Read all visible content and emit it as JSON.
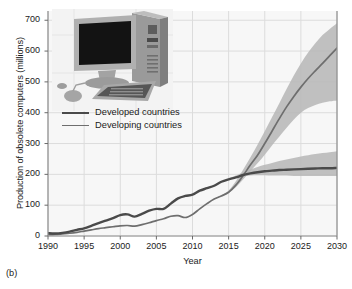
{
  "figure": {
    "caption": "(b)",
    "photo_alt": "desktop-computer-photo"
  },
  "chart_data": {
    "type": "line",
    "title": "",
    "xlabel": "Year",
    "ylabel": "Production of obsolete computers (millions)",
    "xlim": [
      1990,
      2030
    ],
    "ylim": [
      0,
      730
    ],
    "xticks": [
      1990,
      1995,
      2000,
      2005,
      2010,
      2015,
      2020,
      2025,
      2030
    ],
    "yticks": [
      0,
      100,
      200,
      300,
      400,
      500,
      600,
      700
    ],
    "grid": true,
    "legend_position": "upper-left-inside",
    "x": [
      1990,
      1991,
      1992,
      1993,
      1994,
      1995,
      1996,
      1997,
      1998,
      1999,
      2000,
      2001,
      2002,
      2003,
      2004,
      2005,
      2006,
      2007,
      2008,
      2009,
      2010,
      2011,
      2012,
      2013,
      2014,
      2015,
      2016,
      2017,
      2018,
      2019,
      2020,
      2021,
      2022,
      2023,
      2024,
      2025,
      2026,
      2027,
      2028,
      2029,
      2030
    ],
    "series": [
      {
        "name": "Developed countries",
        "color": "#4a4a4a",
        "values": [
          9,
          8,
          10,
          14,
          20,
          25,
          33,
          42,
          50,
          58,
          68,
          70,
          63,
          72,
          82,
          88,
          88,
          105,
          122,
          130,
          134,
          147,
          155,
          163,
          176,
          184,
          190,
          198,
          203,
          207,
          210,
          212,
          214,
          215,
          216,
          217,
          218,
          219,
          220,
          220,
          221
        ],
        "band_low": [
          9,
          8,
          10,
          14,
          20,
          25,
          33,
          42,
          50,
          58,
          68,
          70,
          63,
          72,
          82,
          88,
          88,
          105,
          122,
          130,
          134,
          147,
          155,
          163,
          176,
          184,
          188,
          193,
          196,
          197,
          197,
          196,
          196,
          196,
          195,
          195,
          195,
          195,
          195,
          195,
          195
        ],
        "band_high": [
          9,
          8,
          10,
          14,
          20,
          25,
          33,
          42,
          50,
          58,
          68,
          70,
          63,
          72,
          82,
          88,
          88,
          105,
          122,
          130,
          134,
          147,
          155,
          163,
          176,
          186,
          196,
          207,
          216,
          224,
          231,
          237,
          243,
          248,
          253,
          258,
          262,
          266,
          269,
          272,
          275
        ]
      },
      {
        "name": "Developing countries",
        "color": "#6e6e6e",
        "values": [
          4,
          5,
          7,
          9,
          12,
          16,
          20,
          24,
          27,
          30,
          33,
          34,
          32,
          37,
          43,
          50,
          56,
          64,
          66,
          60,
          70,
          88,
          105,
          120,
          130,
          142,
          165,
          196,
          230,
          262,
          300,
          340,
          380,
          418,
          452,
          483,
          511,
          536,
          560,
          585,
          610
        ],
        "band_low": [
          4,
          5,
          7,
          9,
          12,
          16,
          20,
          24,
          27,
          30,
          33,
          34,
          32,
          37,
          43,
          50,
          56,
          64,
          66,
          60,
          70,
          88,
          105,
          120,
          130,
          140,
          158,
          183,
          210,
          236,
          264,
          294,
          322,
          350,
          377,
          400,
          415,
          425,
          432,
          437,
          440
        ],
        "band_high": [
          4,
          5,
          7,
          9,
          12,
          16,
          20,
          24,
          27,
          30,
          33,
          34,
          32,
          37,
          43,
          50,
          56,
          64,
          66,
          60,
          70,
          88,
          105,
          120,
          132,
          148,
          178,
          215,
          255,
          296,
          340,
          385,
          430,
          476,
          520,
          560,
          595,
          625,
          652,
          672,
          690
        ]
      }
    ],
    "band_color": "#b6b6b6",
    "plot_background": "#f7f7f7",
    "grid_color": "#dcdcdc",
    "axis_color": "#8f8f8f"
  }
}
